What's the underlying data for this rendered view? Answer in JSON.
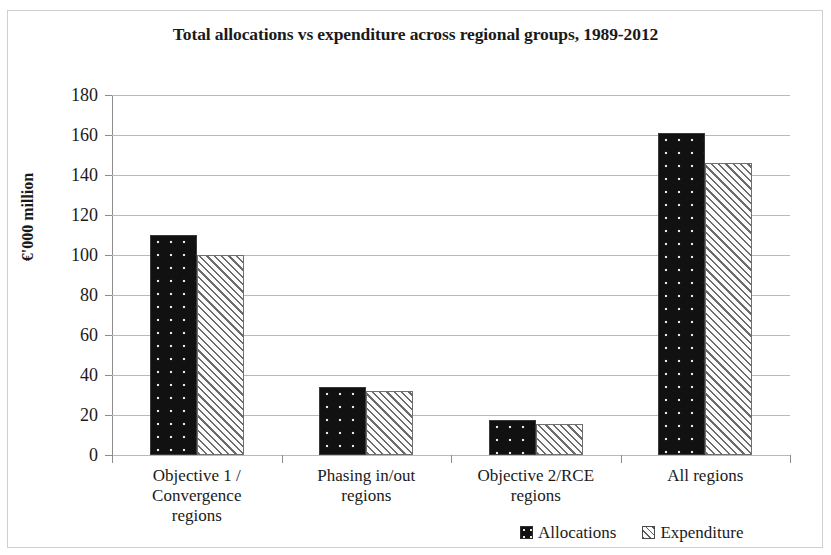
{
  "chart_data": {
    "type": "bar",
    "title": "Total allocations vs expenditure across regional groups, 1989-2012",
    "xlabel": "",
    "ylabel": "€'000 million",
    "ylim": [
      0,
      180
    ],
    "ytick_step": 20,
    "yticks": [
      180,
      160,
      140,
      120,
      100,
      80,
      60,
      40,
      20,
      0
    ],
    "grid": true,
    "legend_position": "bottom-right",
    "categories": [
      "Objective 1 /\nConvergence\nregions",
      "Phasing in/out\nregions",
      "Objective 2/RCE\nregions",
      "All regions"
    ],
    "category_lines": [
      [
        "Objective 1 /",
        "Convergence",
        "regions"
      ],
      [
        "Phasing in/out",
        "regions"
      ],
      [
        "Objective 2/RCE",
        "regions"
      ],
      [
        "All regions"
      ]
    ],
    "series": [
      {
        "name": "Allocations",
        "pattern": "dotted",
        "color": "#111111",
        "values": [
          110,
          34,
          17.5,
          161
        ]
      },
      {
        "name": "Expenditure",
        "pattern": "diagonal-hatch",
        "color": "#f2f2f2",
        "values": [
          100,
          32,
          15.5,
          146
        ]
      }
    ]
  },
  "legend": {
    "items": [
      {
        "label": "Allocations",
        "swatch": "allocations-swatch"
      },
      {
        "label": "Expenditure",
        "swatch": "expenditure-swatch"
      }
    ]
  }
}
